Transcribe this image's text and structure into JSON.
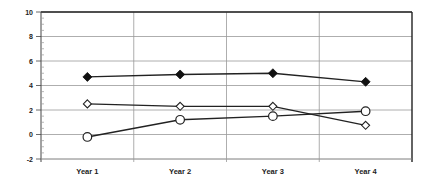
{
  "chart_data": {
    "type": "line",
    "title": "",
    "xlabel": "",
    "ylabel": "",
    "categories": [
      "Year 1",
      "Year 2",
      "Year 3",
      "Year 4"
    ],
    "ylim": [
      -2,
      10
    ],
    "yticks": [
      -2,
      0,
      2,
      4,
      6,
      8,
      10
    ],
    "grid": true,
    "legend": null,
    "series": [
      {
        "name": "Series A (filled diamond)",
        "marker": "filled-diamond",
        "values": [
          4.7,
          4.9,
          5.0,
          4.3
        ]
      },
      {
        "name": "Series B (hollow diamond)",
        "marker": "hollow-diamond",
        "values": [
          2.5,
          2.3,
          2.3,
          0.75
        ]
      },
      {
        "name": "Series C (hollow circle)",
        "marker": "hollow-circle",
        "values": [
          -0.2,
          1.2,
          1.5,
          1.9
        ]
      }
    ]
  },
  "colors": {
    "line": "#222222",
    "grid": "#999999",
    "axis": "#444444"
  }
}
